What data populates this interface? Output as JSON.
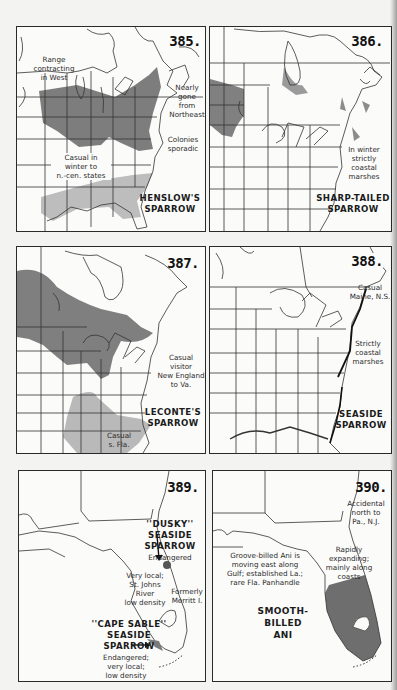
{
  "page": {
    "type": "field-guide range maps",
    "colors": {
      "range_dark": "#7a7a7a",
      "range_light": "#b9b9b9",
      "paper": "#fbfbfa",
      "border": "#2a2a2a"
    }
  },
  "maps": [
    {
      "number": "385.",
      "species": "HENSLOW'S\nSPARROW",
      "notes": [
        "Range\ncontracting\nin West",
        "Nearly\ngone\nfrom\nNortheast",
        "Colonies\nsporadic",
        "Casual in\nwinter to\nn.-cen. states"
      ]
    },
    {
      "number": "386.",
      "species": "SHARP-TAILED\nSPARROW",
      "notes": [
        "In winter\nstrictly\ncoastal\nmarshes"
      ]
    },
    {
      "number": "387.",
      "species": "LECONTE'S\nSPARROW",
      "notes": [
        "Casual visitor\nNew England\nto Va.",
        "Casual\ns. Fla."
      ]
    },
    {
      "number": "388.",
      "species": "SEASIDE\nSPARROW",
      "notes": [
        "Casual\nMaine, N.S.",
        "Strictly\ncoastal\nmarshes"
      ]
    },
    {
      "number": "389.",
      "species": "",
      "labels": [
        {
          "name": "''DUSKY''\nSEASIDE\nSPARROW",
          "status": "Endangered"
        },
        {
          "name": "''CAPE SABLE''\nSEASIDE\nSPARROW",
          "status": "Endangered;\nvery local;\nlow density"
        }
      ],
      "notes": [
        "Very local;\nSt. Johns\nRiver\nlow density",
        "Formerly\nMerritt I."
      ]
    },
    {
      "number": "390.",
      "species": "SMOOTH-\nBILLED\nANI",
      "notes": [
        "Accidental\nnorth to\nPa., N.J.",
        "Rapidly\nexpanding;\nmainly along\ncoasts",
        "Groove-billed Ani is\nmoving east along\nGulf; established La.;\nrare Fla. Panhandle"
      ]
    }
  ]
}
